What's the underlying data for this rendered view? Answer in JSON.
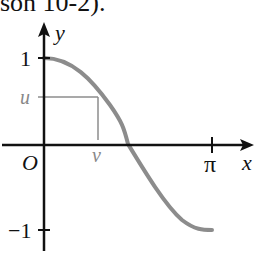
{
  "caption": "son 10-2).",
  "diagram": {
    "x_axis_label": "x",
    "y_axis_label": "y",
    "origin_label": "O",
    "y_ticks": [
      "1",
      "−1"
    ],
    "x_ticks": [
      "π"
    ],
    "u_label": "u",
    "v_label": "v",
    "curve": "y = cos x, 0 ≤ x ≤ π",
    "colors": {
      "axes": "#111111",
      "curve": "#8c8c8c",
      "guide": "#8c8c8c"
    }
  }
}
